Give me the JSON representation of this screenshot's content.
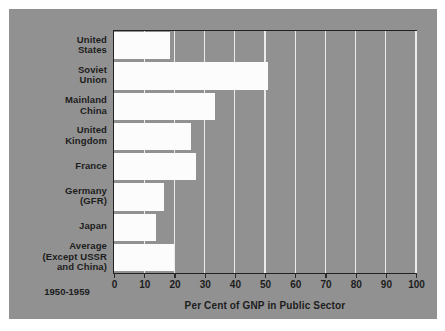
{
  "chart_data": {
    "type": "bar",
    "orientation": "horizontal",
    "title": "",
    "xlabel": "Per Cent of GNP in Public Sector",
    "ylabel": "",
    "period": "1950-1959",
    "xlim": [
      0,
      100
    ],
    "xticks": [
      0,
      10,
      20,
      30,
      40,
      50,
      60,
      70,
      80,
      90,
      100
    ],
    "xtick_labels": [
      "0",
      "10",
      "20",
      "30",
      "40",
      "50",
      "60",
      "70",
      "80",
      "90",
      "100"
    ],
    "grid": true,
    "grid_axis": "x",
    "legend": "none",
    "categories": [
      "United States",
      "Soviet Union",
      "Mainland China",
      "United Kingdom",
      "France",
      "Germany (GFR)",
      "Japan",
      "Average (Except USSR and China)"
    ],
    "category_label_lines": [
      [
        "United",
        "States"
      ],
      [
        "Soviet",
        "Union"
      ],
      [
        "Mainland",
        "China"
      ],
      [
        "United",
        "Kingdom"
      ],
      [
        "France"
      ],
      [
        "Germany",
        "(GFR)"
      ],
      [
        "Japan"
      ],
      [
        "Average",
        "(Except USSR",
        "and China)"
      ]
    ],
    "values": [
      18.5,
      51.0,
      33.5,
      25.5,
      27.0,
      16.5,
      14.0,
      20.0
    ],
    "colors": {
      "card_background": "#919191",
      "plot_background": "#919191",
      "bar_fill": "#fcfcfc",
      "gridline": "#ebebeb",
      "axis_line": "#222222",
      "text": "#1d1d1d",
      "page_background": "#ffffff"
    }
  }
}
